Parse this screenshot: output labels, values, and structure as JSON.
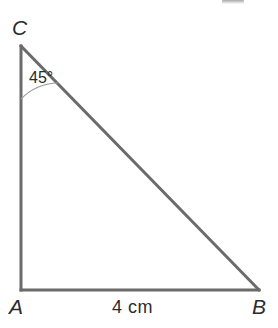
{
  "figure": {
    "kind": "geometry-diagram",
    "shape": "right-triangle",
    "background_color": "#ffffff",
    "stroke_color": "#6b6b6b",
    "stroke_width": 3,
    "arc_color": "#9a9a9a",
    "arc_width": 1,
    "text_color": "#2b2b2b",
    "vertices": [
      {
        "name": "C",
        "label": "C",
        "x": 21,
        "y": 46
      },
      {
        "name": "A",
        "label": "A",
        "x": 21,
        "y": 290
      },
      {
        "name": "B",
        "label": "B",
        "x": 259,
        "y": 290
      }
    ],
    "sides": [
      {
        "name": "CA",
        "from": "C",
        "to": "A"
      },
      {
        "name": "AB",
        "from": "A",
        "to": "B",
        "measure": "4 cm"
      },
      {
        "name": "CB",
        "from": "C",
        "to": "B"
      }
    ],
    "angles": [
      {
        "at": "C",
        "label": "45°",
        "value": 45,
        "unit": "degrees",
        "marked": true
      },
      {
        "at": "A",
        "value": 90,
        "unit": "degrees",
        "marked": false
      },
      {
        "at": "B",
        "value": 45,
        "unit": "degrees",
        "marked": false
      }
    ],
    "labels": {
      "vertex_c": "C",
      "vertex_a": "A",
      "vertex_b": "B",
      "angle_c": "45°",
      "side_ab": "4 cm"
    },
    "artifact": {
      "name": "cropped-text-fragment",
      "present": true
    }
  }
}
